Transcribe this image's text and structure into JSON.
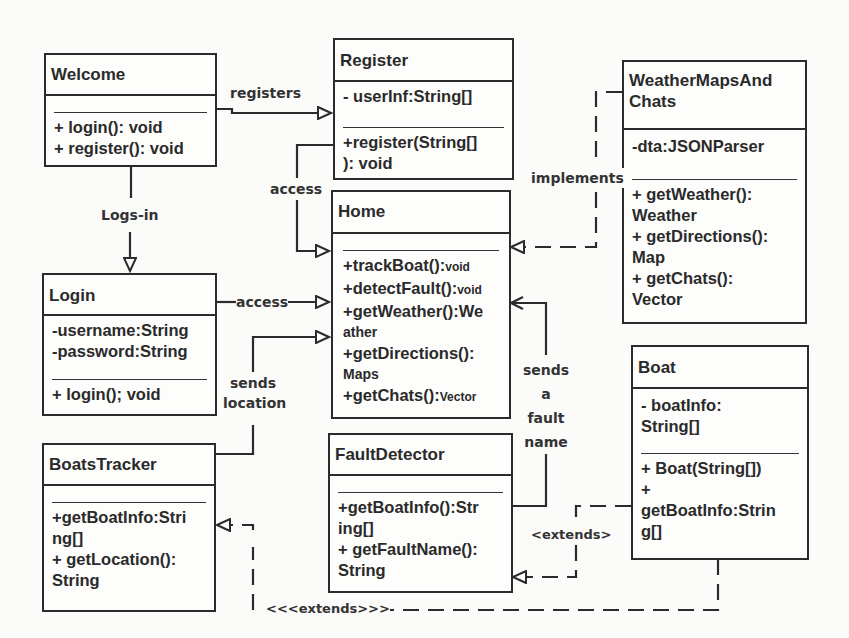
{
  "classes": {
    "welcome": {
      "name": "Welcome",
      "attributes": [],
      "methods": [
        "+ login(): void",
        "+ register(): void"
      ]
    },
    "register": {
      "name": "Register",
      "attributes": [
        "- userInf:String[]"
      ],
      "methods": [
        "+register(String[]",
        "): void"
      ]
    },
    "home": {
      "name": "Home",
      "attributes": [],
      "methods": [
        {
          "main": "+trackBoat():",
          "small": "void"
        },
        {
          "main": "+detectFault():",
          "small": "void"
        },
        {
          "main": "+getWeather():We",
          "small": ""
        },
        {
          "main": "ather",
          "small": ""
        },
        {
          "main": "+getDirections():",
          "small": ""
        },
        {
          "main": "Maps",
          "small": ""
        },
        {
          "main": "+getChats():",
          "small": "Vector"
        }
      ]
    },
    "weather": {
      "name_line1": "WeatherMapsAnd",
      "name_line2": "Chats",
      "attributes": [
        "-dta:JSONParser"
      ],
      "methods": [
        "+ getWeather():",
        "Weather",
        "+ getDirections():",
        "Map",
        "+ getChats():",
        "Vector"
      ]
    },
    "login": {
      "name": "Login",
      "attributes": [
        "-username:String",
        "-password:String"
      ],
      "methods": [
        "+ login(); void"
      ]
    },
    "boats_tracker": {
      "name": "BoatsTracker",
      "attributes": [],
      "methods": [
        "+getBoatInfo:Stri",
        "ng[]",
        "+ getLocation():",
        "String"
      ]
    },
    "fault_detector": {
      "name": "FaultDetector",
      "attributes": [],
      "methods": [
        "+getBoatInfo():Str",
        "ing[]",
        "+ getFaultName():",
        "String"
      ]
    },
    "boat": {
      "name": "Boat",
      "attributes": [
        "- boatInfo:",
        "String[]"
      ],
      "methods": [
        "+ Boat(String[])",
        "+",
        "getBoatInfo:Strin",
        "g[]"
      ]
    }
  },
  "relations": {
    "registers": "registers",
    "access_register": "access",
    "logs_in": "Logs-in",
    "access_login": "access",
    "sends_location_1": "sends",
    "sends_location_2": "location",
    "implements": "implements",
    "sends_fault_1": "sends",
    "sends_fault_2": "a",
    "sends_fault_3": "fault",
    "sends_fault_4": "name",
    "extends_fault": "<extends>",
    "extends_tracker": "<<<extends>>>"
  },
  "colors": {
    "line": "#2b2b2b",
    "background": "#fbfbfa"
  }
}
